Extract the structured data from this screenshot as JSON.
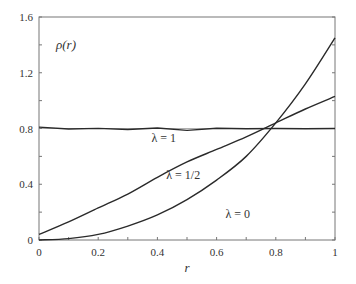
{
  "chart_data": {
    "type": "line",
    "title": "",
    "ylabel": "ρ(r)",
    "xlabel": "r",
    "xlim": [
      0,
      1
    ],
    "ylim": [
      0,
      1.6
    ],
    "grid": false,
    "legend": "inline labels on curves",
    "x_ticks": [
      "0",
      "0.2",
      "0.4",
      "0.6",
      "0.8",
      "1"
    ],
    "y_ticks": [
      "0",
      "0.4",
      "0.8",
      "1.2",
      "1.6"
    ],
    "x": [
      0,
      0.1,
      0.2,
      0.3,
      0.4,
      0.5,
      0.6,
      0.7,
      0.8,
      0.9,
      1.0
    ],
    "series": [
      {
        "name": "λ = 1",
        "values": [
          0.81,
          0.8,
          0.79,
          0.8,
          0.8,
          0.79,
          0.8,
          0.8,
          0.8,
          0.8,
          0.8
        ],
        "label_pos": {
          "x": 0.38,
          "y": 0.7
        }
      },
      {
        "name": "λ = 1/2",
        "values": [
          0.04,
          0.13,
          0.23,
          0.33,
          0.45,
          0.56,
          0.65,
          0.74,
          0.84,
          0.94,
          1.03
        ],
        "label_pos": {
          "x": 0.43,
          "y": 0.44
        }
      },
      {
        "name": "λ = 0",
        "values": [
          0.0,
          0.01,
          0.04,
          0.1,
          0.18,
          0.29,
          0.43,
          0.6,
          0.84,
          1.12,
          1.45
        ],
        "label_pos": {
          "x": 0.63,
          "y": 0.16
        }
      }
    ],
    "annotations": [
      {
        "text": "ρ(r)",
        "x": 0.04,
        "y": 1.37
      }
    ]
  }
}
